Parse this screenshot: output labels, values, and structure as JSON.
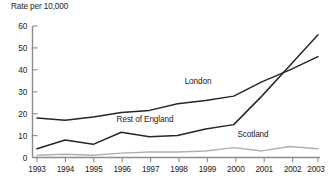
{
  "chart_data": {
    "type": "line",
    "title": "",
    "ylabel": "Rate per 10,000",
    "xlabel": "",
    "ylim": [
      0,
      60
    ],
    "yticks": [
      0,
      10,
      20,
      30,
      40,
      50,
      60
    ],
    "grid": false,
    "legend_position": "inline-labels",
    "x": [
      1993,
      1994,
      1995,
      1996,
      1997,
      1998,
      1999,
      2000,
      2001,
      2002,
      2003
    ],
    "categories": [
      "1993",
      "1994",
      "1995",
      "1996",
      "1997",
      "1998",
      "1999",
      "2000",
      "2001",
      "2002",
      "2003"
    ],
    "series": [
      {
        "name": "London",
        "color": "#262626",
        "values": [
          18,
          17,
          18.5,
          20.5,
          21.5,
          24.5,
          26,
          28,
          34.5,
          40,
          46
        ]
      },
      {
        "name": "Rest of England",
        "color": "#262626",
        "values": [
          4,
          8,
          6,
          11.5,
          9.5,
          10,
          13,
          15,
          28,
          42,
          56
        ]
      },
      {
        "name": "Scotland",
        "color": "#b0b0b0",
        "values": [
          1,
          1.5,
          1,
          2,
          2.5,
          2.5,
          3,
          4.5,
          3,
          5,
          4
        ]
      }
    ],
    "annotations": [
      {
        "text": "London",
        "x": 1999,
        "y": 31
      },
      {
        "text": "Rest of England",
        "x": 1996.6,
        "y": 14
      },
      {
        "text": "Scotland",
        "x": 2000.9,
        "y": 9
      }
    ]
  }
}
